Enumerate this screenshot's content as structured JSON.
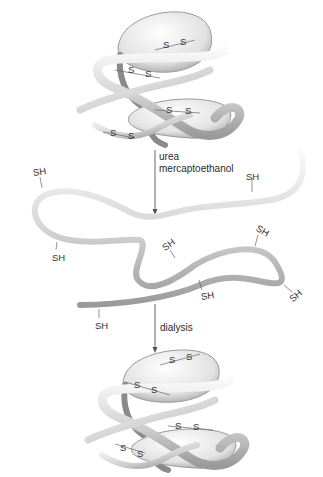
{
  "diagram": {
    "stages": [
      {
        "id": "native-top",
        "state": "native folded protein",
        "bonds": [
          "S-S",
          "S-S",
          "S-S",
          "S-S"
        ]
      },
      {
        "id": "denatured",
        "state": "unfolded reduced chain",
        "groups": [
          "SH",
          "SH",
          "SH",
          "SH",
          "SH",
          "SH",
          "SH",
          "SH"
        ]
      },
      {
        "id": "native-bottom",
        "state": "refolded protein",
        "bonds": [
          "S-S",
          "S-S",
          "S-S",
          "S-S"
        ]
      }
    ],
    "steps": {
      "denature_line1": "urea",
      "denature_line2": "mercaptoethanol",
      "renature": "dialysis"
    },
    "labels": {
      "s": "S",
      "sh": "SH"
    },
    "colors": {
      "ribbon_light": "#f4f4f4",
      "ribbon_mid": "#cfcfcf",
      "ribbon_dark": "#8e8e8e",
      "arrow": "#555555"
    }
  }
}
